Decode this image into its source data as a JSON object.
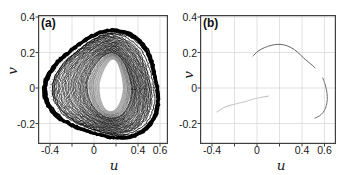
{
  "figure": {
    "bg": "#ffffff",
    "frame_color": "#404040",
    "grid_color": "#d9d9d9",
    "tick_label_color": "#1a1a1a",
    "curve_color": "#0a0a0a"
  },
  "chart_data": [
    {
      "type": "scatter",
      "panel": "(a)",
      "xlabel": "u",
      "ylabel": "v",
      "xlim": [
        -0.51,
        0.67
      ],
      "ylim": [
        -0.315,
        0.41
      ],
      "xticks": [
        -0.4,
        -0.2,
        0,
        0.2,
        0.4,
        0.6
      ],
      "xtick_labels": [
        "-0.4",
        "",
        "0",
        "",
        "0.4",
        "0.6"
      ],
      "yticks": [
        -0.2,
        0,
        0.2,
        0.4
      ],
      "ytick_labels": [
        "-0.2",
        "0",
        "0.2",
        "0.4"
      ],
      "grid": true,
      "description": "Dense chaotic attractor: thousands of nested quasi-periodic orbits forming a rounded-triangular torus with an egg-shaped central hole, fine gray striping around the hole, and a detached thick black outer loop",
      "attractor": {
        "color": "#0a0a0a",
        "inner_stripe_colors": [
          "#bdbdbd",
          "#8f8f8f",
          "#6e6e6e"
        ],
        "hole_center": [
          0.16,
          0.015
        ],
        "hole_radius": [
          0.1,
          0.145
        ],
        "hole_rot_deg": -8,
        "egg_amp": 0.3,
        "outer_center": [
          0.1,
          0.01
        ],
        "outer_radius": [
          0.52,
          0.3
        ],
        "tri_amp": 0.09,
        "tri_phase": 2.6,
        "extent_u": [
          -0.46,
          0.62
        ],
        "extent_v": [
          -0.28,
          0.32
        ]
      }
    },
    {
      "type": "line",
      "panel": "(b)",
      "xlabel": "u",
      "ylabel": "v",
      "xlim": [
        -0.507,
        0.7
      ],
      "ylim": [
        -0.315,
        0.41
      ],
      "xticks": [
        -0.4,
        -0.2,
        0,
        0.2,
        0.4,
        0.6
      ],
      "xtick_labels": [
        "-0.4",
        "",
        "0",
        "",
        "0.4",
        "0.6"
      ],
      "yticks": [
        -0.2,
        0,
        0.2,
        0.4
      ],
      "ytick_labels": [
        "-0.2",
        "0",
        "0.2",
        "0.4"
      ],
      "grid": true,
      "description": "Sparse periodic orbit remnants: an upper arc, a right-side hook arc, and a faint light-gray segment",
      "series": [
        {
          "name": "upper-arc",
          "color": "#666666",
          "width": 1.0,
          "points": [
            [
              -0.036,
              0.18
            ],
            [
              0.01,
              0.208
            ],
            [
              0.065,
              0.227
            ],
            [
              0.125,
              0.24
            ],
            [
              0.185,
              0.246
            ],
            [
              0.245,
              0.242
            ],
            [
              0.305,
              0.227
            ],
            [
              0.36,
              0.202
            ],
            [
              0.41,
              0.172
            ],
            [
              0.455,
              0.147
            ],
            [
              0.49,
              0.129
            ],
            [
              0.516,
              0.113
            ]
          ]
        },
        {
          "name": "right-arc",
          "color": "#6e6e6e",
          "width": 1.0,
          "points": [
            [
              0.585,
              0.056
            ],
            [
              0.605,
              0.022
            ],
            [
              0.618,
              -0.012
            ],
            [
              0.625,
              -0.048
            ],
            [
              0.622,
              -0.082
            ],
            [
              0.608,
              -0.115
            ],
            [
              0.585,
              -0.14
            ],
            [
              0.553,
              -0.158
            ],
            [
              0.515,
              -0.169
            ]
          ]
        },
        {
          "name": "faint-segment",
          "color": "#c8c8c8",
          "width": 1.1,
          "points": [
            [
              -0.356,
              -0.135
            ],
            [
              -0.3,
              -0.112
            ],
            [
              -0.24,
              -0.098
            ],
            [
              -0.17,
              -0.087
            ],
            [
              -0.1,
              -0.076
            ],
            [
              -0.03,
              -0.062
            ],
            [
              0.04,
              -0.052
            ],
            [
              0.1,
              -0.046
            ]
          ]
        }
      ]
    }
  ]
}
